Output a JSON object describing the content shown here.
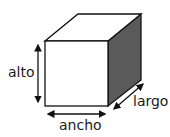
{
  "diagram": {
    "type": "cube-dimensions",
    "labels": {
      "height": "alto",
      "width": "ancho",
      "length": "largo"
    },
    "colors": {
      "edge": "#111111",
      "front_face": "#ffffff",
      "top_face": "#ffffff",
      "side_face": "#5a5a5a"
    }
  }
}
